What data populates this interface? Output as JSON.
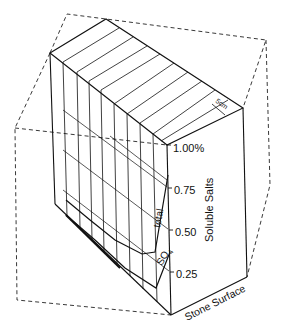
{
  "figure": {
    "type": "3d-block-diagram"
  },
  "axis": {
    "title": "Soluble Salts",
    "ticks": [
      "1.00%",
      "0.75",
      "0.50",
      "0.25"
    ]
  },
  "labels": {
    "scale": "5cm",
    "surface": "Stone Surface",
    "curve_total": "total",
    "curve_so4": "SO",
    "curve_so4_sub": "4"
  },
  "colors": {
    "line": "#111111",
    "background": "#ffffff"
  }
}
